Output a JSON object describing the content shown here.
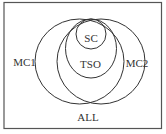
{
  "diagram": {
    "type": "euler-venn",
    "frame": {
      "label": "ALL",
      "stroke": "#555555"
    },
    "sets": [
      {
        "id": "MC1",
        "label": "MC1"
      },
      {
        "id": "MC2",
        "label": "MC2"
      },
      {
        "id": "TSO",
        "label": "TSO"
      },
      {
        "id": "SC",
        "label": "SC"
      }
    ],
    "relations": [
      "SC is contained in TSO",
      "TSO is contained in MC1 and MC2",
      "MC1 and MC2 overlap",
      "All sets are contained in ALL"
    ],
    "colors": {
      "stroke": "#333333",
      "text": "#333333",
      "background": "#ffffff"
    }
  },
  "labels": {
    "all": "ALL",
    "mc1": "MC1",
    "mc2": "MC2",
    "tso": "TSO",
    "sc": "SC"
  }
}
